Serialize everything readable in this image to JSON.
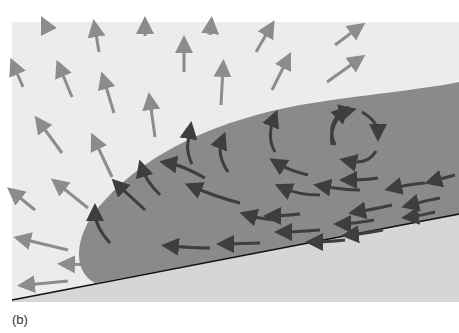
{
  "figure": {
    "panel_label": "(b)",
    "colors": {
      "background_fluid": "#ececec",
      "dense_current": "#8a8a8a",
      "ground": "#d6d6d6",
      "ambient_arrow": "#8c8c8c",
      "current_arrow": "#3e3e3e",
      "slope_line": "#111111"
    },
    "elements": {
      "ambient_flow": "outward-pointing arrows in ambient fluid",
      "dense_current": "gravity current body on sloping bed",
      "vortex": "circulating arrows in the head of the current",
      "slope": "inclined bed line"
    }
  }
}
